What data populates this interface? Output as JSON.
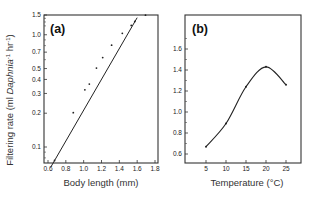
{
  "chart_data": [
    {
      "type": "scatter",
      "panel_label": "(a)",
      "title": "",
      "xlabel": "Body length (mm)",
      "ylabel": "Filtering rate (ml Daphnia⁻¹ hr⁻¹)",
      "yscale": "log",
      "xlim": [
        0.57,
        1.82
      ],
      "ylim": [
        0.07,
        1.5
      ],
      "xticks": [
        "0.6",
        "0.8",
        "1.0",
        "1.2",
        "1.4",
        "1.6",
        "1.8"
      ],
      "yticks": [
        "0.1",
        "0.2",
        "0.3",
        "0.4",
        "0.5",
        "0.7",
        "1.0",
        "1.5"
      ],
      "grid": false,
      "series": [
        {
          "name": "observations",
          "x": [
            0.66,
            0.87,
            1.0,
            1.05,
            1.13,
            1.2,
            1.3,
            1.42,
            1.52,
            1.56,
            1.68
          ],
          "y": [
            0.075,
            0.2,
            0.32,
            0.36,
            0.5,
            0.62,
            0.8,
            1.02,
            1.2,
            1.3,
            1.48
          ]
        },
        {
          "name": "fitted regression line",
          "x": [
            0.63,
            1.6
          ],
          "y": [
            0.066,
            1.42
          ]
        }
      ]
    },
    {
      "type": "line",
      "panel_label": "(b)",
      "title": "",
      "xlabel": "Temperature (°C)",
      "ylabel": "",
      "xlim": [
        0,
        29
      ],
      "ylim": [
        0.5,
        1.9
      ],
      "xticks": [
        "5",
        "10",
        "15",
        "20",
        "25"
      ],
      "yticks": [
        "0.6",
        "0.8",
        "1.0",
        "1.2",
        "1.4",
        "1.6"
      ],
      "grid": false,
      "series": [
        {
          "name": "filtering rate",
          "x": [
            5,
            10,
            15,
            20,
            25
          ],
          "y": [
            0.67,
            0.89,
            1.24,
            1.43,
            1.26
          ]
        }
      ]
    }
  ]
}
